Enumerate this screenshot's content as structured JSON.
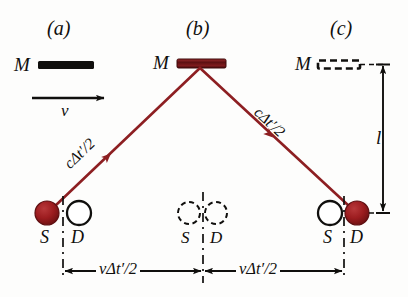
{
  "figure": {
    "colors": {
      "ray": "#8d1f22",
      "mirror_b_fill": "#6e1416",
      "source_fill": "#9e1b1e",
      "ink": "#100f0d",
      "background": "#fdfdfc"
    },
    "panels": [
      {
        "tag": "(a)",
        "mirror_label": "M",
        "mirror_style": "solid-black-bar"
      },
      {
        "tag": "(b)",
        "mirror_label": "M",
        "mirror_style": "solid-dark-red-bar"
      },
      {
        "tag": "(c)",
        "mirror_label": "M",
        "mirror_style": "dashed-outline-bar"
      }
    ],
    "velocity_label": "v",
    "ray_labels": {
      "left": "cΔt′/2",
      "right": "cΔt′/2"
    },
    "dimension_labels": {
      "vertical": "l",
      "horizontal_left": "vΔt′/2",
      "horizontal_right": "vΔt′/2"
    },
    "stations": {
      "left": {
        "source": "S",
        "detector": "D",
        "source_state": "filled",
        "detector_state": "open"
      },
      "middle": {
        "source": "S",
        "detector": "D",
        "source_state": "dashed",
        "detector_state": "dashed"
      },
      "right": {
        "source": "S",
        "detector": "D",
        "source_state": "open",
        "detector_state": "filled"
      }
    }
  }
}
